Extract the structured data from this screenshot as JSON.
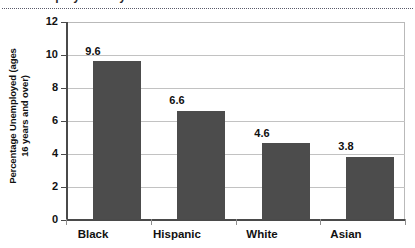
{
  "clipped_title": {
    "remnant_text": "Unemployment by Race"
  },
  "chart_data": {
    "type": "bar",
    "title": "",
    "xlabel": "",
    "ylabel": "Percentage Unemployed (ages 16 years and over)",
    "ylabel_line1": "Percentage Unemployed (ages",
    "ylabel_line2": "16 years and over)",
    "categories": [
      "Black",
      "Hispanic",
      "White",
      "Asian"
    ],
    "values": [
      9.6,
      6.6,
      4.6,
      3.8
    ],
    "value_labels": [
      "9.6",
      "6.6",
      "4.6",
      "3.8"
    ],
    "ylim": [
      0,
      12
    ],
    "ytick_step": 2,
    "ytick_labels": [
      "0",
      "2",
      "4",
      "6",
      "8",
      "10",
      "12"
    ],
    "grid": true,
    "legend": "none",
    "bar_color": "#4c4c4c",
    "gridline_color": "#c2c2c2",
    "axis_color": "#4a4a4a"
  }
}
